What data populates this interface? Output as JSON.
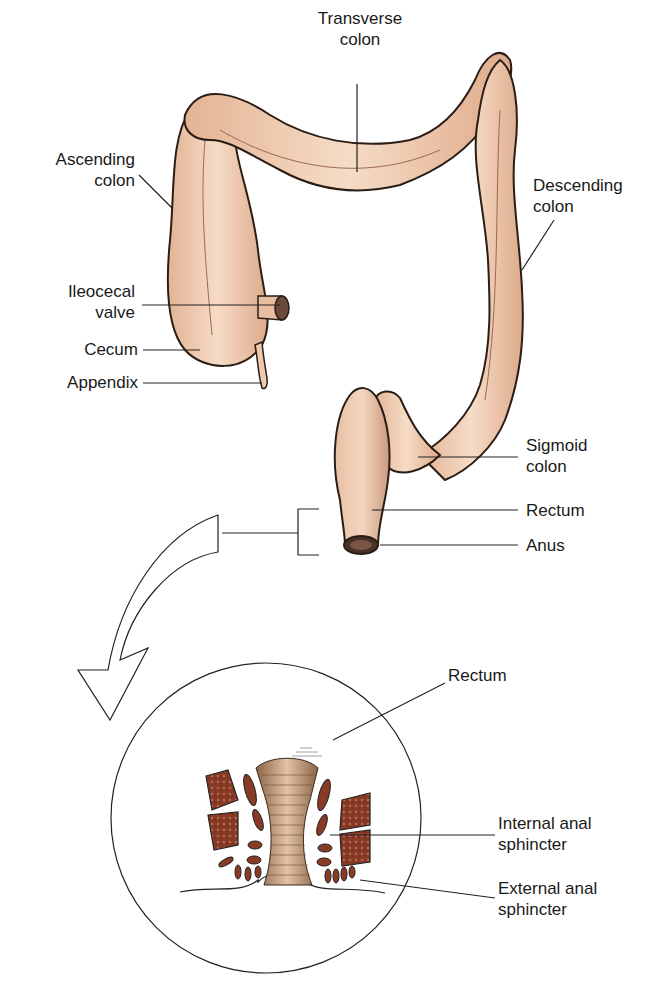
{
  "figure": {
    "colors": {
      "colon_fill": "#f1cdb2",
      "colon_shade": "#d99a7c",
      "outline": "#2a1d16",
      "muscle": "#8a3b26",
      "rectum_inset": "#b38b6a",
      "leader": "#222222"
    }
  },
  "labels": {
    "transverse_colon": "Transverse\ncolon",
    "ascending_colon": "Ascending\ncolon",
    "descending_colon": "Descending\ncolon",
    "ileocecal_valve": "Ileocecal\nvalve",
    "cecum": "Cecum",
    "appendix": "Appendix",
    "sigmoid_colon": "Sigmoid\ncolon",
    "rectum": "Rectum",
    "anus": "Anus"
  },
  "inset": {
    "rectum": "Rectum",
    "internal_anal_sphincter": "Internal anal\nsphincter",
    "external_anal_sphincter": "External anal\nsphincter"
  }
}
